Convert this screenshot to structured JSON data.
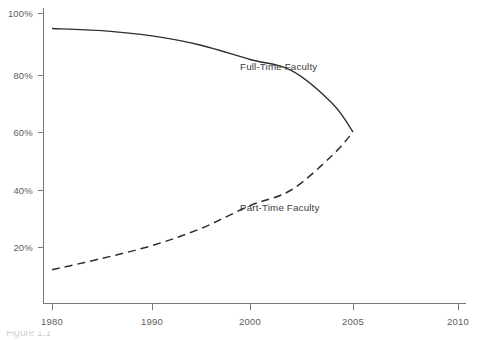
{
  "chart_data": {
    "type": "line",
    "title": "",
    "subtitle": "",
    "xlabel": "",
    "ylabel": "",
    "xlim": [
      1978,
      2011
    ],
    "ylim": [
      0,
      104
    ],
    "grid": false,
    "legend_position": "inline-annotations",
    "x_tick_labels": [
      "1980",
      "1990",
      "2000",
      "2005",
      "2010"
    ],
    "x_tick_values": [
      1980,
      1990,
      2000,
      2005,
      2010
    ],
    "x_tick_px": [
      52,
      152,
      250,
      353,
      458
    ],
    "y_tick_labels": [
      "20%",
      "40%",
      "60%",
      "80%",
      "100%"
    ],
    "y_tick_values": [
      20,
      40,
      60,
      80,
      100
    ],
    "y_tick_px": [
      247,
      190,
      132,
      75,
      13
    ],
    "series": [
      {
        "name": "Full-Time Faculty",
        "style": "solid",
        "color": "#2e2e2e",
        "annotation": "Full-Time Faculty",
        "x": [
          1980,
          1985,
          1990,
          1995,
          2000,
          2002,
          2004,
          2005
        ],
        "values": [
          95,
          94.3,
          92.6,
          89.6,
          85,
          81.5,
          70,
          60
        ]
      },
      {
        "name": "Part-Time Faculty",
        "style": "dashed",
        "color": "#2e2e2e",
        "annotation": "Part-Time Faculty",
        "x": [
          1980,
          1985,
          1990,
          1995,
          2000,
          2002,
          2004,
          2005
        ],
        "values": [
          12,
          16,
          20.5,
          26.5,
          34.5,
          40,
          52,
          60
        ]
      }
    ]
  },
  "annotations": {
    "full_time": "Full-Time Faculty",
    "part_time": "Part-Time Faculty"
  },
  "ticks": {
    "y": {
      "t100": "100%",
      "t80": "80%",
      "t60": "60%",
      "t40": "40%",
      "t20": "20%"
    },
    "x": {
      "t1980": "1980",
      "t1990": "1990",
      "t2000": "2000",
      "t2005": "2005",
      "t2010": "2010"
    }
  },
  "caption": {
    "clipped_text": "Figure 1.1"
  },
  "colors": {
    "line": "#2e2e2e",
    "axis": "#7a7a7a",
    "tick_text": "#5d5d5d",
    "background": "#ffffff"
  }
}
